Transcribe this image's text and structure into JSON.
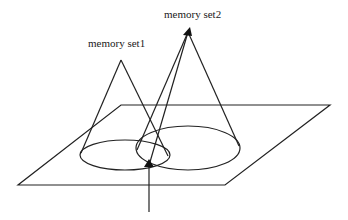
{
  "diagram": {
    "labels": {
      "set1": "memory set1",
      "set2": "memory set2"
    },
    "elements": [
      {
        "type": "plane",
        "shape": "parallelogram"
      },
      {
        "type": "cone",
        "name": "memory set1",
        "apex": [
          121,
          60
        ]
      },
      {
        "type": "cone",
        "name": "memory set2",
        "apex": [
          188,
          30
        ]
      },
      {
        "type": "ellipse",
        "name": "set1 base",
        "center": [
          125,
          155
        ]
      },
      {
        "type": "ellipse",
        "name": "set2 base",
        "center": [
          187,
          148
        ]
      },
      {
        "type": "arrow",
        "name": "query arrow",
        "direction": "up"
      },
      {
        "type": "arrow",
        "name": "set2 apex arrow",
        "direction": "up"
      }
    ]
  },
  "colors": {
    "stroke": "#222222",
    "background": "#ffffff"
  }
}
